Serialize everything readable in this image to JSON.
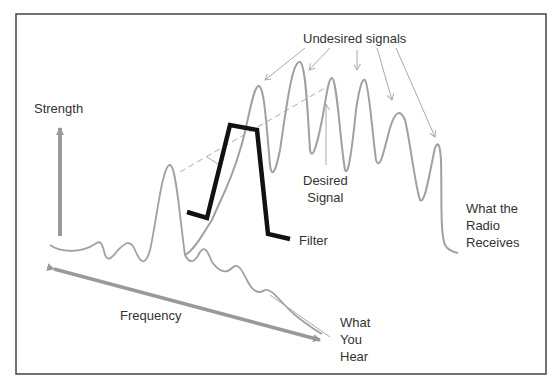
{
  "labels": {
    "strength": "Strength",
    "frequency": "Frequency",
    "undesired": "Undesired signals",
    "desired": "Desired\nSignal",
    "filter": "Filter",
    "radio": "What the\nRadio\nReceives",
    "hear": "What\nYou\nHear"
  },
  "colors": {
    "signal": "#a0a0a0",
    "axis": "#999999",
    "filter": "#111111",
    "text": "#333333",
    "border": "#444444"
  }
}
